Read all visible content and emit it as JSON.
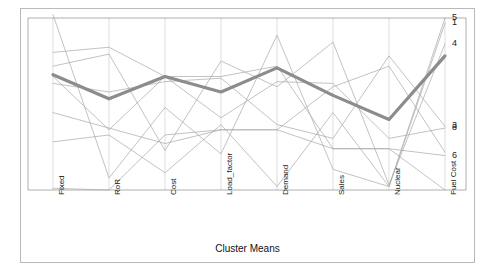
{
  "figure": {
    "title": "Cluster Means",
    "background_color": "#ffffff",
    "frame_color": "#b9b9b9",
    "axis_color": "#9a9a9a",
    "gridline_color": "#d0d0d0",
    "mean_line_color": "#8c8c8c",
    "series_line_color": "#a8a8a8"
  },
  "chart_data": {
    "type": "line",
    "subtype": "parallel-coordinates",
    "title": "Cluster Means",
    "xlabel": "Cluster Means",
    "ylabel": "",
    "grid": true,
    "legend": "right-edge-endpoint-labels",
    "categories": [
      "Fixed",
      "RoR",
      "Cost",
      "Load_factor",
      "Demand",
      "Sales",
      "Nuclear",
      "Fuel Cost"
    ],
    "ylim": [
      0,
      1
    ],
    "yticks": [],
    "series": [
      {
        "name": "5",
        "label": "5",
        "emphasis": false,
        "values": [
          1.02,
          0.07,
          0.48,
          0.21,
          0.9,
          0.12,
          0.02,
          1.0
        ]
      },
      {
        "name": "1",
        "label": "1",
        "emphasis": false,
        "values": [
          0.28,
          0.32,
          0.1,
          0.38,
          0.02,
          0.45,
          0.02,
          0.97
        ]
      },
      {
        "name": "4",
        "label": "4",
        "emphasis": false,
        "values": [
          0.72,
          0.79,
          0.23,
          0.75,
          0.6,
          0.86,
          0.03,
          0.85
        ]
      },
      {
        "name": "3",
        "label": "3",
        "emphasis": false,
        "values": [
          0.62,
          0.57,
          0.63,
          0.65,
          0.38,
          0.3,
          0.78,
          0.37
        ]
      },
      {
        "name": "8",
        "label": "8",
        "emphasis": false,
        "values": [
          0.66,
          0.35,
          0.66,
          0.42,
          0.63,
          0.62,
          0.3,
          0.36
        ]
      },
      {
        "name": "6",
        "label": "6",
        "emphasis": false,
        "values": [
          0.45,
          0.36,
          0.27,
          0.35,
          0.35,
          0.24,
          0.24,
          0.2
        ]
      },
      {
        "name": "2",
        "label": "",
        "emphasis": false,
        "values": [
          0.8,
          0.83,
          0.66,
          0.66,
          0.72,
          0.24,
          0.24,
          0.0
        ]
      },
      {
        "name": "7",
        "label": "",
        "emphasis": false,
        "values": [
          0.01,
          0.0,
          0.32,
          0.35,
          0.35,
          0.6,
          0.72,
          0.22
        ]
      },
      {
        "name": "mean",
        "label": "",
        "emphasis": true,
        "values": [
          0.67,
          0.53,
          0.66,
          0.57,
          0.71,
          0.55,
          0.41,
          0.78
        ]
      }
    ],
    "annotations": [
      {
        "text": "5",
        "axis": "Fuel Cost",
        "value": 1.0
      },
      {
        "text": "1",
        "axis": "Fuel Cost",
        "value": 0.97
      },
      {
        "text": "4",
        "axis": "Fuel Cost",
        "value": 0.85
      },
      {
        "text": "3",
        "axis": "Fuel Cost",
        "value": 0.37
      },
      {
        "text": "8",
        "axis": "Fuel Cost",
        "value": 0.36
      },
      {
        "text": "6",
        "axis": "Fuel Cost",
        "value": 0.2
      }
    ]
  },
  "axis_labels": [
    {
      "text": "Fixed"
    },
    {
      "text": "RoR"
    },
    {
      "text": "Cost"
    },
    {
      "text": "Load_factor"
    },
    {
      "text": "Demand"
    },
    {
      "text": "Sales"
    },
    {
      "text": "Nuclear"
    },
    {
      "text": "Fuel Cost"
    }
  ],
  "series_labels": [
    {
      "text": "5"
    },
    {
      "text": "1"
    },
    {
      "text": "4"
    },
    {
      "text": "3"
    },
    {
      "text": "8"
    },
    {
      "text": "6"
    }
  ]
}
